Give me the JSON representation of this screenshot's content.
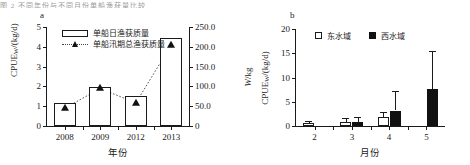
{
  "topstrip": {
    "text": "图 2  不同年份与不同月份单船渔获量比较"
  },
  "panel_a": {
    "letter": "a",
    "legend": [
      {
        "key": "bar-white",
        "label": "单船日渔获质量"
      },
      {
        "key": "line-triangle",
        "label": "单船汛期总渔获质量"
      }
    ],
    "y_left_title_main": "CPUE",
    "y_left_title_sub": "W",
    "y_left_title_unit": "/(kg/d)",
    "y_right_title_main": "W",
    "y_right_title_unit": "/kg",
    "x_title": "年份"
  },
  "panel_b": {
    "letter": "b",
    "legend": [
      {
        "key": "square-white",
        "label": "东水域"
      },
      {
        "key": "square-black",
        "label": "西水域"
      }
    ],
    "y_title_main": "CPUE",
    "y_title_sub": "W",
    "y_title_unit": "/(kg/d)",
    "x_title": "月份"
  },
  "chart_data": [
    {
      "type": "bar",
      "id": "panel-a",
      "title": "a",
      "xlabel": "年份",
      "ylabel": "CPUE_W/(kg/d)",
      "y2label": "W/kg",
      "categories": [
        "2008",
        "2009",
        "2012",
        "2013"
      ],
      "ylim": [
        0,
        5
      ],
      "yticks": [
        "0",
        "1",
        "2",
        "3",
        "4",
        "5"
      ],
      "ytickvals": [
        0,
        1,
        2,
        3,
        4,
        5
      ],
      "y2lim": [
        0,
        250
      ],
      "y2ticks": [
        "0",
        "50.0",
        "100.0",
        "150.0",
        "200.0",
        "250.0"
      ],
      "y2tickvals": [
        0,
        50,
        100,
        150,
        200,
        250
      ],
      "grid": false,
      "legend_position": "top-left",
      "series": [
        {
          "name": "单船日渔获质量",
          "style": "bar-white",
          "axis": "left",
          "values": [
            1.15,
            1.95,
            1.5,
            4.45
          ]
        },
        {
          "name": "单船汛期总渔获质量",
          "style": "dotted-line-triangle",
          "axis": "right",
          "values": [
            45,
            95,
            58,
            205
          ]
        }
      ]
    },
    {
      "type": "bar",
      "id": "panel-b",
      "title": "b",
      "xlabel": "月份",
      "ylabel": "CPUE_W/(kg/d)",
      "categories": [
        "2",
        "3",
        "4",
        "5"
      ],
      "ylim": [
        0,
        20
      ],
      "yticks": [
        "0",
        "5",
        "10",
        "15",
        "20"
      ],
      "ytickvals": [
        0,
        5,
        10,
        15,
        20
      ],
      "grid": false,
      "legend_position": "top-center",
      "series": [
        {
          "name": "东水域",
          "style": "bar-white",
          "values": [
            0.65,
            0.85,
            1.85,
            null
          ],
          "errors": [
            0.35,
            0.75,
            1.1,
            null
          ]
        },
        {
          "name": "西水域",
          "style": "bar-black",
          "values": [
            null,
            0.9,
            3.2,
            7.7
          ],
          "errors": [
            null,
            1.0,
            4.0,
            7.8
          ]
        }
      ]
    }
  ]
}
